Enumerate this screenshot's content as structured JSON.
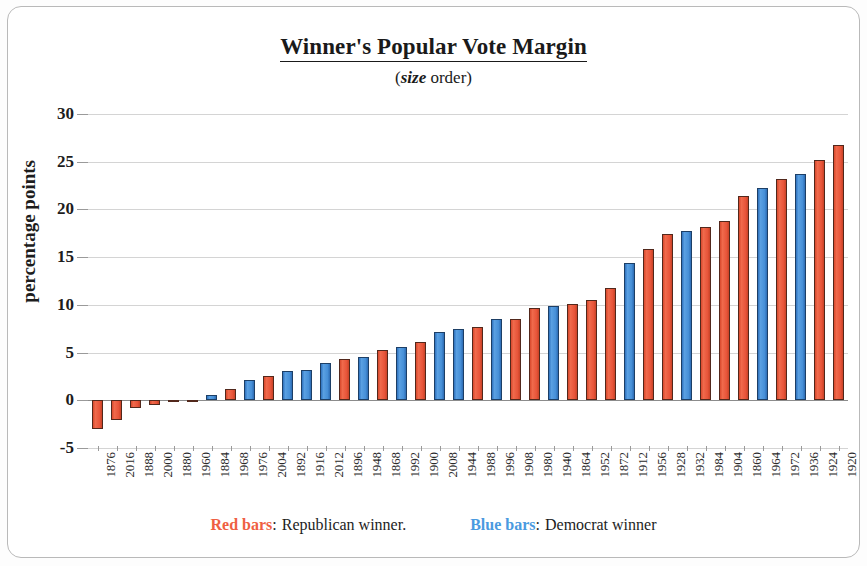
{
  "chart_data": {
    "type": "bar",
    "title": "Winner's Popular Vote Margin",
    "subtitle_prefix": "(",
    "subtitle_emphasis": "size",
    "subtitle_suffix": " order)",
    "xlabel": "",
    "ylabel": "percentage points",
    "ylim": [
      -5,
      30
    ],
    "yticks": [
      -5,
      0,
      5,
      10,
      15,
      20,
      25,
      30
    ],
    "grid": true,
    "legend_position": "bottom",
    "categories": [
      "1876",
      "2016",
      "1888",
      "2000",
      "1880",
      "1960",
      "1884",
      "1968",
      "1976",
      "2004",
      "1892",
      "1916",
      "2012",
      "1896",
      "1948",
      "1868",
      "1992",
      "1900",
      "2008",
      "1944",
      "1988",
      "1996",
      "1908",
      "1980",
      "1940",
      "1864",
      "1952",
      "1872",
      "1912",
      "1956",
      "1928",
      "1932",
      "1984",
      "1904",
      "1860",
      "1964",
      "1972",
      "1936",
      "1924",
      "1920"
    ],
    "values": [
      -3.0,
      -2.1,
      -0.8,
      -0.5,
      -0.1,
      -0.1,
      0.6,
      1.2,
      2.1,
      2.5,
      3.1,
      3.2,
      3.9,
      4.3,
      4.5,
      5.3,
      5.6,
      6.1,
      7.2,
      7.5,
      7.7,
      8.5,
      8.5,
      9.7,
      9.9,
      10.1,
      10.5,
      11.8,
      14.4,
      15.9,
      17.4,
      17.7,
      18.2,
      18.8,
      21.4,
      22.2,
      23.2,
      23.7,
      25.2,
      26.8
    ],
    "party": [
      "red",
      "red",
      "red",
      "red",
      "red",
      "red",
      "blue",
      "red",
      "blue",
      "red",
      "blue",
      "blue",
      "blue",
      "red",
      "blue",
      "red",
      "blue",
      "red",
      "blue",
      "blue",
      "red",
      "blue",
      "red",
      "red",
      "blue",
      "red",
      "red",
      "red",
      "blue",
      "red",
      "red",
      "blue",
      "red",
      "red",
      "red",
      "blue",
      "red",
      "blue",
      "red",
      "red"
    ],
    "colors": {
      "red": "#e8553a",
      "blue": "#4790d8"
    }
  },
  "legend": {
    "red_key": "Red bars",
    "red_sep": ":",
    "red_text": "Republican winner.",
    "blue_key": "Blue bars",
    "blue_sep": ":",
    "blue_text": "Democrat winner"
  }
}
